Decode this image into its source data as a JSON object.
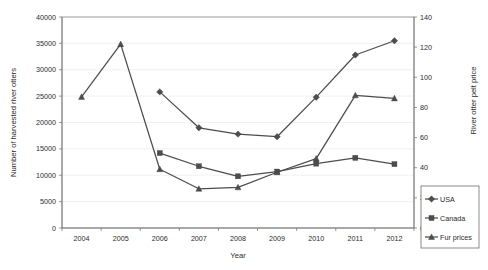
{
  "chart_data": {
    "type": "line",
    "title": "",
    "xlabel": "Year",
    "ylabel": "Number of harvested river otters",
    "y2label": "River otter pelt price",
    "x": [
      2004,
      2005,
      2006,
      2007,
      2008,
      2009,
      2010,
      2011,
      2012
    ],
    "categories": [
      "2004",
      "2005",
      "2006",
      "2007",
      "2008",
      "2009",
      "2010",
      "2011",
      "2012"
    ],
    "ylim": [
      0,
      40000
    ],
    "y2lim": [
      0,
      140
    ],
    "yticks": [
      0,
      5000,
      10000,
      15000,
      20000,
      25000,
      30000,
      35000,
      40000
    ],
    "ytick_labels": [
      "0",
      "5000",
      "10000",
      "15000",
      "20000",
      "25000",
      "30000",
      "35000",
      "40000"
    ],
    "y2ticks": [
      0,
      20,
      40,
      60,
      80,
      100,
      120,
      140
    ],
    "y2tick_labels": [
      "0",
      "20",
      "40",
      "60",
      "80",
      "100",
      "120",
      "140"
    ],
    "grid": true,
    "legend_position": "bottom-right",
    "series": [
      {
        "name": "USA",
        "axis": "left",
        "marker": "diamond",
        "color": "#4d4d4d",
        "x": [
          2006,
          2007,
          2008,
          2009,
          2010,
          2011,
          2012
        ],
        "values": [
          25800,
          19000,
          17800,
          17300,
          24800,
          32800,
          35500
        ]
      },
      {
        "name": "Canada",
        "axis": "left",
        "marker": "square",
        "color": "#4d4d4d",
        "x": [
          2006,
          2007,
          2008,
          2009,
          2010,
          2011,
          2012
        ],
        "values": [
          14200,
          11700,
          9800,
          10700,
          12200,
          13300,
          12100
        ]
      },
      {
        "name": "Fur prices",
        "axis": "right",
        "marker": "triangle",
        "color": "#4d4d4d",
        "x": [
          2004,
          2005,
          2006,
          2007,
          2008,
          2009,
          2010,
          2011,
          2012
        ],
        "values": [
          87,
          122,
          39,
          26,
          27,
          37,
          46,
          88,
          86
        ]
      }
    ]
  },
  "legend": {
    "items": [
      {
        "label": "USA",
        "marker": "diamond"
      },
      {
        "label": "Canada",
        "marker": "square"
      },
      {
        "label": "Fur prices",
        "marker": "triangle"
      }
    ]
  }
}
